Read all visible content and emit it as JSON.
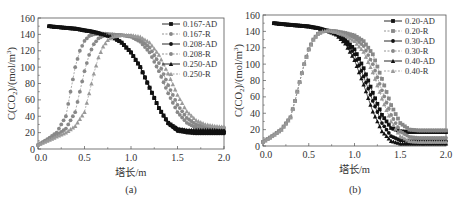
{
  "chart_data": [
    {
      "type": "line",
      "panel": "(a)",
      "caption": "(a)",
      "xlabel": "塔长/m",
      "ylabel": "C(CO2)/(mol/m3)",
      "xlim": [
        0.0,
        2.0
      ],
      "ylim": [
        0,
        160
      ],
      "xticks": [
        "0.0",
        "0.5",
        "1.0",
        "1.5",
        "2.0"
      ],
      "yticks": [
        "0",
        "20",
        "40",
        "60",
        "80",
        "100",
        "120",
        "140",
        "160"
      ],
      "grid": false,
      "legend_position": "upper right",
      "series": [
        {
          "name": "0.167-AD",
          "style": "solid",
          "marker": "square",
          "color": "#111111",
          "x": [
            0.12,
            0.2,
            0.3,
            0.4,
            0.5,
            0.6,
            0.7,
            0.8,
            0.9,
            1.0,
            1.1,
            1.2,
            1.3,
            1.4,
            1.5,
            1.6,
            1.7,
            1.8,
            1.9,
            2.0
          ],
          "y": [
            150,
            149,
            148,
            147,
            145,
            143,
            140,
            137,
            130,
            118,
            100,
            75,
            50,
            32,
            24,
            22,
            21,
            21,
            21,
            21
          ]
        },
        {
          "name": "0.167-R",
          "style": "dashed",
          "marker": "circle",
          "color": "#888888",
          "x": [
            0.0,
            0.1,
            0.2,
            0.3,
            0.35,
            0.4,
            0.45,
            0.5,
            0.55,
            0.6,
            0.7,
            0.8,
            0.9,
            1.0,
            1.1,
            1.2,
            1.3,
            1.4,
            1.5,
            1.6,
            1.7,
            1.8,
            1.9,
            2.0
          ],
          "y": [
            5,
            12,
            20,
            40,
            70,
            100,
            120,
            132,
            138,
            140,
            141,
            140,
            139,
            137,
            131,
            118,
            95,
            68,
            45,
            32,
            26,
            24,
            23,
            23
          ]
        },
        {
          "name": "0.208-AD",
          "style": "solid",
          "marker": "circle",
          "color": "#111111",
          "x": [
            0.12,
            0.2,
            0.3,
            0.4,
            0.5,
            0.6,
            0.7,
            0.8,
            0.9,
            1.0,
            1.1,
            1.2,
            1.3,
            1.4,
            1.5,
            1.6,
            1.7,
            1.8,
            1.9,
            2.0
          ],
          "y": [
            150,
            149,
            148,
            147,
            145,
            143,
            140,
            137,
            130,
            118,
            100,
            75,
            50,
            31,
            22,
            20,
            19,
            19,
            19,
            19
          ]
        },
        {
          "name": "0.208-R",
          "style": "dashed",
          "marker": "circle",
          "color": "#888888",
          "x": [
            0.0,
            0.1,
            0.2,
            0.3,
            0.4,
            0.45,
            0.5,
            0.55,
            0.6,
            0.65,
            0.7,
            0.8,
            0.9,
            1.0,
            1.1,
            1.2,
            1.3,
            1.4,
            1.5,
            1.6,
            1.7,
            1.8,
            1.9,
            2.0
          ],
          "y": [
            5,
            11,
            17,
            25,
            45,
            70,
            95,
            115,
            128,
            135,
            138,
            140,
            139,
            138,
            134,
            124,
            105,
            78,
            54,
            38,
            30,
            27,
            26,
            26
          ]
        },
        {
          "name": "0.250-AD",
          "style": "solid",
          "marker": "triangle",
          "color": "#111111",
          "x": [
            0.12,
            0.2,
            0.3,
            0.4,
            0.5,
            0.6,
            0.7,
            0.8,
            0.9,
            1.0,
            1.1,
            1.2,
            1.3,
            1.4,
            1.5,
            1.6,
            1.7,
            1.8,
            1.9,
            2.0
          ],
          "y": [
            150,
            149,
            148,
            147,
            145,
            143,
            140,
            137,
            130,
            118,
            100,
            75,
            50,
            32,
            25,
            23,
            23,
            23,
            23,
            23
          ]
        },
        {
          "name": "0.250-R",
          "style": "dashed",
          "marker": "triangle",
          "color": "#999999",
          "x": [
            0.0,
            0.1,
            0.2,
            0.3,
            0.4,
            0.5,
            0.55,
            0.6,
            0.65,
            0.7,
            0.75,
            0.8,
            0.9,
            1.0,
            1.1,
            1.2,
            1.3,
            1.4,
            1.5,
            1.6,
            1.7,
            1.8,
            1.9,
            2.0
          ],
          "y": [
            5,
            10,
            15,
            20,
            28,
            45,
            68,
            92,
            112,
            125,
            133,
            137,
            139,
            139,
            137,
            130,
            115,
            92,
            66,
            46,
            35,
            30,
            28,
            27
          ]
        }
      ]
    },
    {
      "type": "line",
      "panel": "(b)",
      "caption": "(b)",
      "xlabel": "塔长/m",
      "ylabel": "C(CO2)/(mol/m3)",
      "xlim": [
        0.0,
        2.0
      ],
      "ylim": [
        0,
        160
      ],
      "xticks": [
        "0.0",
        "0.5",
        "1.0",
        "1.5",
        "2.0"
      ],
      "yticks": [
        "0",
        "20",
        "40",
        "60",
        "80",
        "100",
        "120",
        "140",
        "160"
      ],
      "grid": false,
      "legend_position": "upper right",
      "series": [
        {
          "name": "0.20-AD",
          "style": "solid",
          "marker": "square",
          "color": "#111111",
          "x": [
            0.12,
            0.2,
            0.3,
            0.4,
            0.5,
            0.6,
            0.7,
            0.8,
            0.9,
            1.0,
            1.1,
            1.2,
            1.3,
            1.4,
            1.5,
            1.6,
            1.7,
            1.8,
            1.9,
            2.0
          ],
          "y": [
            150,
            149,
            148,
            147,
            146,
            144,
            141,
            137,
            130,
            118,
            95,
            65,
            38,
            22,
            18,
            17,
            17,
            17,
            17,
            17
          ]
        },
        {
          "name": "0.20-R",
          "style": "dashed",
          "marker": "square",
          "color": "#888888",
          "x": [
            0.0,
            0.1,
            0.2,
            0.3,
            0.35,
            0.4,
            0.45,
            0.5,
            0.55,
            0.6,
            0.65,
            0.7,
            0.8,
            0.9,
            1.0,
            1.1,
            1.2,
            1.3,
            1.4,
            1.5,
            1.6,
            1.7,
            1.8,
            1.9,
            2.0
          ],
          "y": [
            5,
            12,
            20,
            35,
            55,
            78,
            100,
            118,
            130,
            137,
            140,
            141,
            140,
            138,
            135,
            128,
            112,
            82,
            50,
            28,
            20,
            19,
            19,
            19,
            19
          ]
        },
        {
          "name": "0.30-AD",
          "style": "solid",
          "marker": "circle",
          "color": "#111111",
          "x": [
            0.12,
            0.2,
            0.3,
            0.4,
            0.5,
            0.6,
            0.7,
            0.8,
            0.9,
            1.0,
            1.1,
            1.2,
            1.3,
            1.4,
            1.5,
            1.6,
            1.7,
            1.8,
            1.9,
            2.0
          ],
          "y": [
            150,
            149,
            148,
            147,
            146,
            144,
            141,
            137,
            128,
            112,
            85,
            55,
            28,
            12,
            7,
            6,
            6,
            6,
            6,
            6
          ]
        },
        {
          "name": "0.30-R",
          "style": "dashed",
          "marker": "circle",
          "color": "#888888",
          "x": [
            0.0,
            0.1,
            0.2,
            0.3,
            0.35,
            0.4,
            0.45,
            0.5,
            0.55,
            0.6,
            0.65,
            0.7,
            0.8,
            0.9,
            1.0,
            1.1,
            1.2,
            1.3,
            1.4,
            1.5,
            1.6,
            1.7,
            1.8,
            1.9,
            2.0
          ],
          "y": [
            5,
            12,
            20,
            35,
            55,
            78,
            100,
            118,
            130,
            137,
            140,
            141,
            140,
            137,
            132,
            122,
            100,
            68,
            38,
            18,
            11,
            10,
            10,
            10,
            10
          ]
        },
        {
          "name": "0.40-AD",
          "style": "solid",
          "marker": "triangle",
          "color": "#111111",
          "x": [
            0.12,
            0.2,
            0.3,
            0.4,
            0.5,
            0.6,
            0.7,
            0.8,
            0.9,
            1.0,
            1.1,
            1.2,
            1.3,
            1.4,
            1.5,
            1.6,
            1.7,
            1.8,
            1.9,
            2.0
          ],
          "y": [
            150,
            149,
            148,
            147,
            146,
            144,
            141,
            136,
            125,
            105,
            75,
            42,
            18,
            6,
            3,
            3,
            3,
            3,
            3,
            3
          ]
        },
        {
          "name": "0.40-R",
          "style": "dashed",
          "marker": "triangle",
          "color": "#999999",
          "x": [
            0.0,
            0.1,
            0.2,
            0.3,
            0.35,
            0.4,
            0.45,
            0.5,
            0.55,
            0.6,
            0.65,
            0.7,
            0.8,
            0.9,
            1.0,
            1.1,
            1.2,
            1.3,
            1.4,
            1.5,
            1.6,
            1.7,
            1.8,
            1.9,
            2.0
          ],
          "y": [
            5,
            12,
            20,
            35,
            55,
            78,
            100,
            118,
            130,
            137,
            140,
            141,
            139,
            135,
            128,
            115,
            90,
            58,
            30,
            12,
            6,
            5,
            5,
            5,
            5
          ]
        }
      ]
    }
  ]
}
